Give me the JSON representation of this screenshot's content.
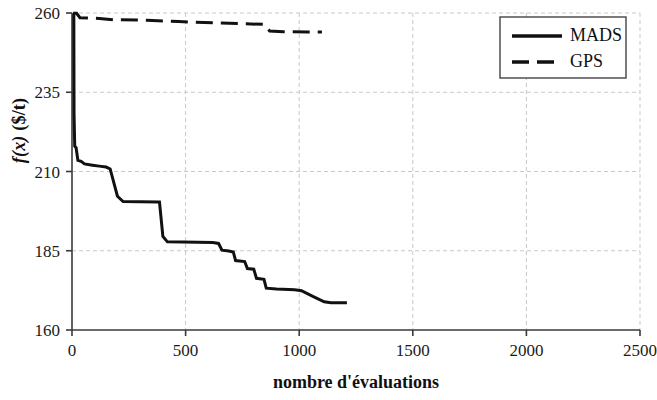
{
  "chart_data": {
    "type": "line",
    "title": "",
    "xlabel": "nombre  d'évaluations",
    "ylabel": "f(x) ($/t)",
    "ylabel_italic_part": "f(x)",
    "ylabel_rest": " ($/t)",
    "xlim": [
      0,
      2500
    ],
    "ylim": [
      160,
      260
    ],
    "xticks": [
      0,
      500,
      1000,
      1500,
      2000,
      2500
    ],
    "xtick_labels": [
      "0",
      "500",
      "1000",
      "1500",
      "2000",
      "2500"
    ],
    "yticks": [
      160,
      185,
      210,
      235,
      260
    ],
    "ytick_labels": [
      "160",
      "185",
      "210",
      "235",
      "260"
    ],
    "grid": true,
    "grid_style": "dashed-light-gray",
    "legend_position": "top-right",
    "series": [
      {
        "name": "MADS",
        "style": "solid",
        "color": "#111111",
        "width": 3,
        "points": [
          [
            5,
            259.8
          ],
          [
            8,
            259.8
          ],
          [
            9,
            228.0
          ],
          [
            12,
            218.0
          ],
          [
            18,
            217.5
          ],
          [
            26,
            213.5
          ],
          [
            40,
            213.2
          ],
          [
            55,
            212.4
          ],
          [
            90,
            212.0
          ],
          [
            120,
            211.7
          ],
          [
            150,
            211.4
          ],
          [
            168,
            210.8
          ],
          [
            200,
            202.2
          ],
          [
            225,
            200.5
          ],
          [
            380,
            200.4
          ],
          [
            385,
            200.4
          ],
          [
            400,
            189.5
          ],
          [
            420,
            187.8
          ],
          [
            620,
            187.6
          ],
          [
            645,
            187.3
          ],
          [
            660,
            185.2
          ],
          [
            690,
            184.9
          ],
          [
            710,
            184.6
          ],
          [
            720,
            181.9
          ],
          [
            760,
            181.6
          ],
          [
            772,
            179.4
          ],
          [
            800,
            179.2
          ],
          [
            812,
            176.3
          ],
          [
            845,
            176.0
          ],
          [
            855,
            173.2
          ],
          [
            900,
            172.9
          ],
          [
            980,
            172.7
          ],
          [
            1010,
            172.4
          ],
          [
            1060,
            170.6
          ],
          [
            1110,
            168.9
          ],
          [
            1140,
            168.6
          ],
          [
            1210,
            168.6
          ]
        ]
      },
      {
        "name": "GPS",
        "style": "dashed",
        "color": "#111111",
        "width": 3,
        "points": [
          [
            5,
            259.9
          ],
          [
            20,
            259.9
          ],
          [
            35,
            258.5
          ],
          [
            120,
            258.3
          ],
          [
            180,
            257.9
          ],
          [
            330,
            257.7
          ],
          [
            470,
            257.3
          ],
          [
            620,
            256.9
          ],
          [
            760,
            256.6
          ],
          [
            845,
            256.4
          ],
          [
            870,
            254.3
          ],
          [
            930,
            254.1
          ],
          [
            1040,
            254.0
          ],
          [
            1100,
            254.0
          ]
        ]
      }
    ]
  },
  "legend": {
    "entries": [
      {
        "label": "MADS",
        "style": "solid"
      },
      {
        "label": "GPS",
        "style": "dashed"
      }
    ]
  }
}
